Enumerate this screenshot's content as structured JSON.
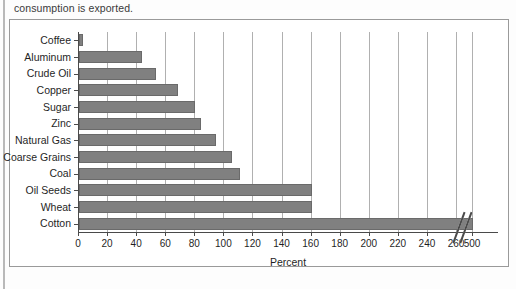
{
  "page": {
    "caption_tail": "consumption is exported."
  },
  "chart_data": {
    "type": "bar",
    "orientation": "horizontal",
    "title": "",
    "subtitle": "",
    "xlabel": "Percent",
    "ylabel": "",
    "categories": [
      "Coffee",
      "Aluminum",
      "Crude Oil",
      "Copper",
      "Sugar",
      "Zinc",
      "Natural Gas",
      "Coarse Grains",
      "Coal",
      "Oil Seeds",
      "Wheat",
      "Cotton"
    ],
    "values": [
      3,
      43,
      53,
      68,
      80,
      84,
      94,
      105,
      111,
      160,
      160,
      500
    ],
    "xticks": [
      0,
      20,
      40,
      60,
      80,
      100,
      120,
      140,
      160,
      180,
      200,
      220,
      240,
      260,
      500
    ],
    "xtick_labels": [
      "0",
      "20",
      "40",
      "60",
      "80",
      "100",
      "120",
      "140",
      "160",
      "180",
      "200",
      "220",
      "240",
      "260",
      "500"
    ],
    "gridlines": [
      20,
      40,
      60,
      80,
      100,
      120,
      140,
      160,
      180,
      200,
      220,
      240,
      260,
      500
    ],
    "xlim": [
      0,
      500
    ],
    "axis_break": {
      "present": true,
      "after": 260,
      "before": 500
    },
    "grid": true,
    "legend": null,
    "bar_color": "#808080",
    "bar_edge_color": "#6a6a6a",
    "axis_color": "#4a4a4a",
    "grid_color": "#b0b0b0"
  }
}
